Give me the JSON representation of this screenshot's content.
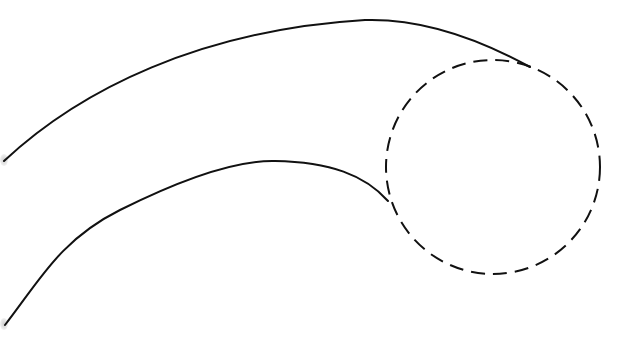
{
  "diagram": {
    "canvas": {
      "width": 634,
      "height": 343,
      "background": "#ffffff"
    },
    "stroke_color": "#111111",
    "shapes": [
      {
        "name": "upper-curve",
        "type": "path",
        "style": "solid",
        "d": "M 4 161 C 80 90, 200 30, 365 20 C 430 18, 490 45, 530 67"
      },
      {
        "name": "lower-curve",
        "type": "path",
        "style": "solid",
        "d": "M 5 325 C 40 280, 60 240, 120 210 C 170 185, 230 160, 275 161 C 330 162, 365 175, 388 201"
      },
      {
        "name": "dashed-circle",
        "type": "circle",
        "style": "dashed",
        "cx": 493,
        "cy": 167,
        "r": 107
      }
    ]
  }
}
